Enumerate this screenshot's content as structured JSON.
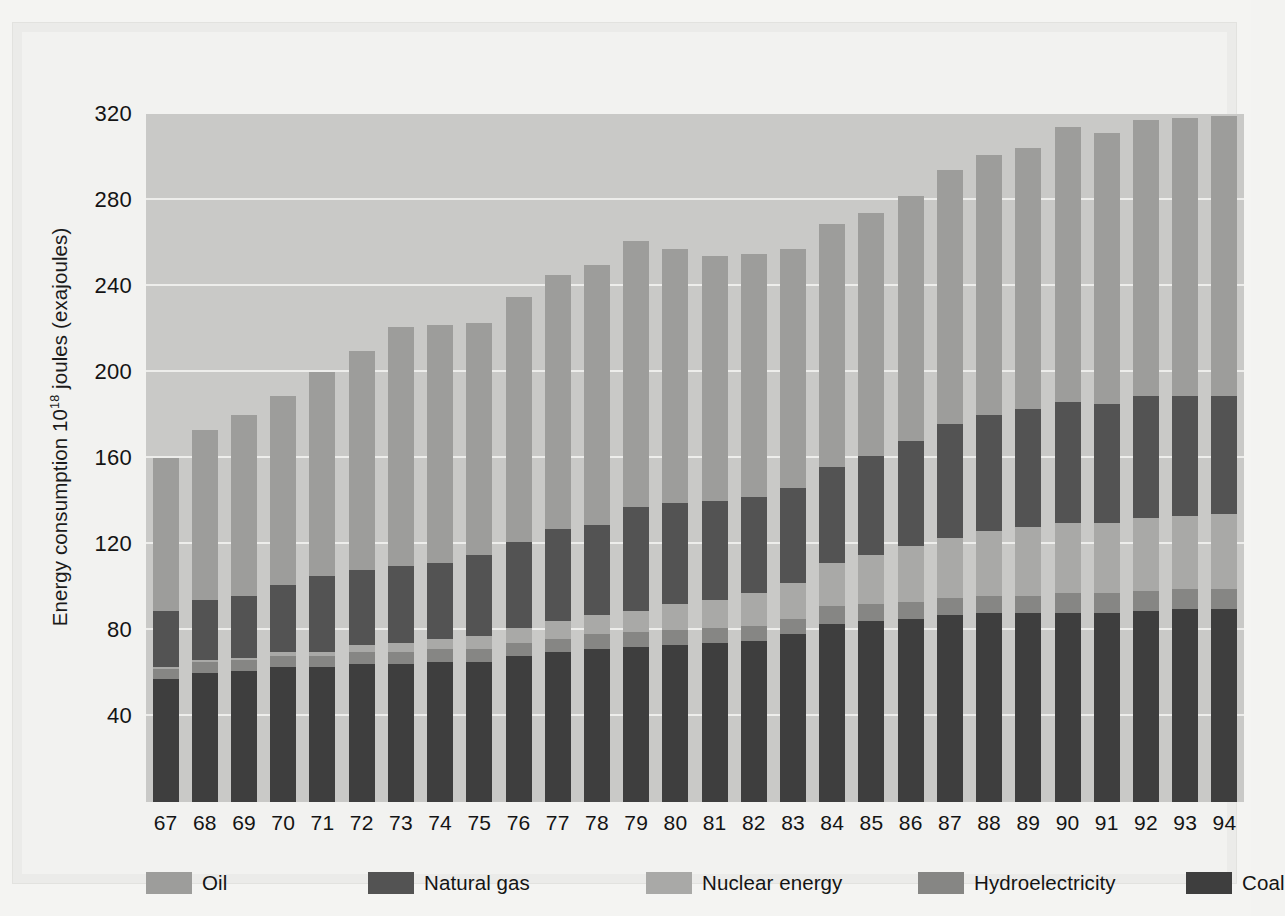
{
  "figure": {
    "y_axis_title_prefix": "Energy consumption 10",
    "y_axis_title_exponent": "18",
    "y_axis_title_suffix": " joules (exajoules)"
  },
  "legend": {
    "position": "bottom",
    "items": [
      {
        "label": "Oil",
        "color": "#9d9d9b",
        "key": "oil"
      },
      {
        "label": "Natural gas",
        "color": "#535353",
        "key": "natural_gas"
      },
      {
        "label": "Nuclear energy",
        "color": "#a9a9a7",
        "key": "nuclear"
      },
      {
        "label": "Hydroelectricity",
        "color": "#868684",
        "key": "hydro"
      },
      {
        "label": "Coal",
        "color": "#3e3e3e",
        "key": "coal"
      }
    ]
  },
  "chart_data": {
    "type": "bar",
    "subtype": "stacked-bar",
    "title": "",
    "xlabel": "",
    "ylabel": "Energy consumption 10^18 joules (exajoules)",
    "ylim": [
      0,
      320
    ],
    "yticks": [
      40,
      80,
      120,
      160,
      200,
      240,
      280,
      320
    ],
    "grid": true,
    "grid_axis": "y",
    "plot_background": "#c9c9c7",
    "gridline_color": "#f0f0ee",
    "categories": [
      "67",
      "68",
      "69",
      "70",
      "71",
      "72",
      "73",
      "74",
      "75",
      "76",
      "77",
      "78",
      "79",
      "80",
      "81",
      "82",
      "83",
      "84",
      "85",
      "86",
      "87",
      "88",
      "89",
      "90",
      "91",
      "92",
      "93",
      "94"
    ],
    "stack_order_bottom_to_top": [
      "coal",
      "hydro",
      "nuclear",
      "natural_gas",
      "oil"
    ],
    "series": [
      {
        "name": "Coal",
        "key": "coal",
        "color": "#3e3e3e",
        "values": [
          57,
          60,
          61,
          63,
          63,
          64,
          64,
          65,
          65,
          68,
          70,
          71,
          72,
          73,
          74,
          75,
          78,
          83,
          84,
          85,
          87,
          88,
          88,
          88,
          88,
          89,
          90,
          90
        ]
      },
      {
        "name": "Hydroelectricity",
        "key": "hydro",
        "color": "#868684",
        "values": [
          5,
          5,
          5,
          5,
          5,
          6,
          6,
          6,
          6,
          6,
          6,
          7,
          7,
          7,
          7,
          7,
          7,
          8,
          8,
          8,
          8,
          8,
          8,
          9,
          9,
          9,
          9,
          9
        ]
      },
      {
        "name": "Nuclear energy",
        "key": "nuclear",
        "color": "#a9a9a7",
        "values": [
          1,
          1,
          1,
          2,
          2,
          3,
          4,
          5,
          6,
          7,
          8,
          9,
          10,
          12,
          13,
          15,
          17,
          20,
          23,
          26,
          28,
          30,
          32,
          33,
          33,
          34,
          34,
          35
        ]
      },
      {
        "name": "Natural gas",
        "key": "natural_gas",
        "color": "#535353",
        "values": [
          26,
          28,
          29,
          31,
          35,
          35,
          36,
          35,
          38,
          40,
          43,
          42,
          48,
          47,
          46,
          45,
          44,
          45,
          46,
          49,
          53,
          54,
          55,
          56,
          55,
          57,
          56,
          55
        ]
      },
      {
        "name": "Oil",
        "key": "oil",
        "color": "#9d9d9b",
        "values": [
          71,
          79,
          84,
          88,
          95,
          102,
          111,
          111,
          108,
          114,
          118,
          121,
          124,
          118,
          114,
          113,
          111,
          113,
          113,
          114,
          118,
          121,
          121,
          128,
          126,
          128,
          129,
          130
        ]
      }
    ],
    "totals": [
      160,
      173,
      180,
      192,
      200,
      210,
      221,
      222,
      223,
      235,
      245,
      250,
      261,
      257,
      254,
      255,
      257,
      269,
      274,
      282,
      294,
      301,
      304,
      314,
      311,
      315,
      317,
      319
    ]
  }
}
